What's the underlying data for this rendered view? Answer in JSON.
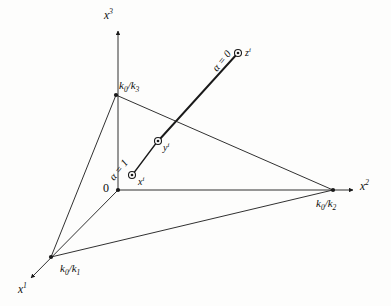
{
  "figure": {
    "background_color": "#fdfdfc",
    "stroke_color": "#1a1a1a",
    "axes": [
      {
        "name": "x1",
        "label_html": "x",
        "superscript": "1",
        "label_x": 18,
        "label_y": 286
      },
      {
        "name": "x2",
        "label_html": "x",
        "superscript": "2",
        "label_x": 360,
        "label_y": 181
      },
      {
        "name": "x3",
        "label_html": "x",
        "superscript": "3",
        "label_x": 104,
        "label_y": 10
      }
    ],
    "origin_label": "0",
    "vertices": [
      {
        "name": "k0-over-k1",
        "num": "k",
        "num_sub": "0",
        "den": "k",
        "den_sub": "1",
        "label_x": 64,
        "label_y": 262
      },
      {
        "name": "k0-over-k2",
        "num": "k",
        "num_sub": "0",
        "den": "k",
        "den_sub": "2",
        "label_x": 316,
        "label_y": 199
      },
      {
        "name": "k0-over-k3",
        "num": "k",
        "num_sub": "0",
        "den": "k",
        "den_sub": "3",
        "label_x": 119,
        "label_y": 80
      }
    ],
    "points": [
      {
        "name": "x-i",
        "label": "x",
        "superscript": "i",
        "alpha_label": "α = 1",
        "x": 132,
        "y": 175
      },
      {
        "name": "y-i",
        "label": "y",
        "superscript": "i",
        "alpha_label": "",
        "x": 158,
        "y": 141
      },
      {
        "name": "z-i",
        "label": "z",
        "superscript": "i",
        "alpha_label": "α = 0",
        "x": 238,
        "y": 53
      }
    ]
  },
  "labels": {
    "x1": "x",
    "x1_sup": "1",
    "x2": "x",
    "x2_sup": "2",
    "x3": "x",
    "x3_sup": "3",
    "origin": "0",
    "k0": "k",
    "k0_sub": "0",
    "k1": "k",
    "k1_sub": "1",
    "k2": "k",
    "k2_sub": "2",
    "k3": "k",
    "k3_sub": "3",
    "slash": "/",
    "xi": "x",
    "xi_sup": "i",
    "yi": "y",
    "yi_sup": "i",
    "zi": "z",
    "zi_sup": "i",
    "alpha_one": "α = 1",
    "alpha_zero": "α = 0"
  }
}
